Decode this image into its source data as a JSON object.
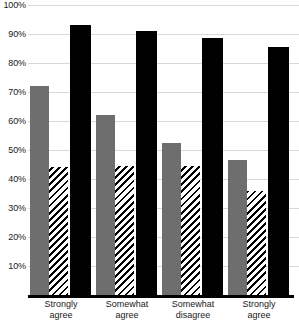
{
  "chart_data": {
    "type": "bar",
    "title": "",
    "subtitle": "",
    "xlabel": "",
    "ylabel": "",
    "ylim": [
      0,
      100
    ],
    "grid": true,
    "legend_position": "none",
    "categories": [
      "Strongly agree",
      "Somewhat agree",
      "Somewhat disagree",
      "Strongly agree"
    ],
    "category_lines": [
      {
        "line1": "Strongly",
        "line2": "agree"
      },
      {
        "line1": "Somewhat",
        "line2": "agree"
      },
      {
        "line1": "Somewhat",
        "line2": "disagree"
      },
      {
        "line1": "Strongly",
        "line2": "agree"
      }
    ],
    "series": [
      {
        "name": "gray-solid",
        "style": "solid-gray",
        "color": "#6E6E6E",
        "values": [
          72,
          62,
          52.5,
          46.5
        ]
      },
      {
        "name": "hatched",
        "style": "diagonal-hatch",
        "color": "#000000",
        "values": [
          44,
          44.5,
          44.5,
          36
        ]
      },
      {
        "name": "black-solid",
        "style": "solid-black",
        "color": "#000000",
        "values": [
          93,
          91,
          88.5,
          85.5
        ]
      }
    ],
    "y_ticks": [
      {
        "value": 100,
        "label": "100%"
      },
      {
        "value": 90,
        "label": "90%"
      },
      {
        "value": 80,
        "label": "80%"
      },
      {
        "value": 70,
        "label": "70%"
      },
      {
        "value": 60,
        "label": "60%"
      },
      {
        "value": 50,
        "label": "50%"
      },
      {
        "value": 40,
        "label": "40%"
      },
      {
        "value": 30,
        "label": "30%"
      },
      {
        "value": 20,
        "label": "20%"
      },
      {
        "value": 10,
        "label": "10%"
      }
    ],
    "colors": {
      "gridline": "#D8D8D8",
      "axis": "#000000",
      "gray_series": "#6E6E6E",
      "black_series": "#000000",
      "background": "#FFFFFF",
      "text": "#1A1A1A"
    }
  },
  "caption": {
    "cropped_text": ""
  }
}
